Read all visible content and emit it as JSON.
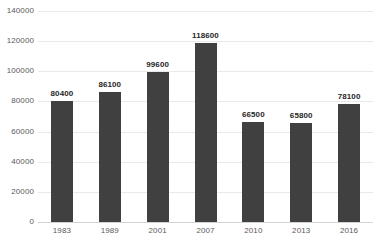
{
  "chart_data": {
    "type": "bar",
    "title": "",
    "subtitle": "",
    "xlabel": "",
    "ylabel": "",
    "categories": [
      "1983",
      "1989",
      "2001",
      "2007",
      "2010",
      "2013",
      "2016"
    ],
    "values": [
      80400,
      86100,
      99600,
      118600,
      66500,
      65800,
      78100
    ],
    "data_labels": [
      "80400",
      "86100",
      "99600",
      "118600",
      "66500",
      "65800",
      "78100"
    ],
    "series": [
      {
        "name": "",
        "values": [
          80400,
          86100,
          99600,
          118600,
          66500,
          65800,
          78100
        ]
      }
    ],
    "ylim": [
      0,
      140000
    ],
    "y_ticks": [
      0,
      20000,
      40000,
      60000,
      80000,
      100000,
      120000,
      140000
    ],
    "y_tick_labels": [
      "0",
      "20000",
      "40000",
      "60000",
      "80000",
      "100000",
      "120000",
      "140000"
    ],
    "grid": true,
    "grid_axis": "y",
    "legend": false,
    "legend_position": "none",
    "bar_color": "#404040",
    "grid_color": "#e9e9e9",
    "axis_color": "#d3d3d3",
    "tick_label_color": "#5a5a5a",
    "data_label_color": "#262626",
    "background_color": "#ffffff"
  }
}
